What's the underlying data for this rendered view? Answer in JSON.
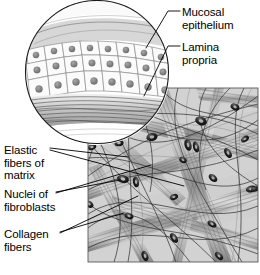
{
  "figure": {
    "background_color": "#ffffff",
    "line_color": "#000000",
    "tissue_fill": "#d9d9d9",
    "fiber_dark": "#5a5a5a",
    "nucleus_color": "#1a1a1a"
  },
  "labels": {
    "mucosal_epithelium": "Mucosal\nepithelium",
    "lamina_propria": "Lamina\npropria",
    "elastic_fibers": "Elastic\nfibers of\nmatrix",
    "nuclei_fibroblasts": "Nuclei of\nfibroblasts",
    "collagen_fibers": "Collagen\nfibers"
  },
  "inset": {
    "shape": "circle",
    "center_x": 97,
    "center_y": 72,
    "radius": 72,
    "description": "Magnified view of mucosal epithelium over lamina propria",
    "epithelium_cell_rows": 3,
    "nucleus_count": 34
  },
  "main_panel": {
    "x": 88,
    "y": 88,
    "width": 170,
    "height": 174,
    "description": "Areolar connective tissue with collagen bundles, elastic fibers and fibroblast nuclei",
    "collagen_bundle_count": 9,
    "elastic_fiber_count": 22,
    "nuclei_count": 18
  },
  "leaders": {
    "mucosal_epithelium": "line from label to epithelial cell layer in inset",
    "lamina_propria": "line from label to fibrous band beneath epithelium",
    "elastic_fibers": "line from label to thin dark fiber in main panel",
    "nuclei_fibroblasts": "two lines from label to dark elliptical nuclei",
    "collagen_fibers": "two lines from label to thick banded collagen bundles"
  }
}
